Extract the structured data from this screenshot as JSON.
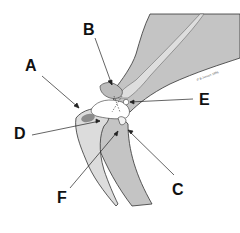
{
  "diagram": {
    "credit": "© B Jensen 1996",
    "labels": [
      {
        "id": "A",
        "text": "A",
        "x": 25,
        "y": 58
      },
      {
        "id": "B",
        "text": "B",
        "x": 83,
        "y": 22
      },
      {
        "id": "C",
        "text": "C",
        "x": 172,
        "y": 182
      },
      {
        "id": "D",
        "text": "D",
        "x": 14,
        "y": 134
      },
      {
        "id": "E",
        "text": "E",
        "x": 199,
        "y": 92
      },
      {
        "id": "F",
        "text": "F",
        "x": 57,
        "y": 190
      }
    ],
    "colors": {
      "bone_dark": "#b8b8b8",
      "bone_mid": "#c8c8c8",
      "bone_light": "#dcdcdc",
      "marrow": "#8c8c8c",
      "outline": "#333333",
      "background": "#ffffff"
    }
  }
}
